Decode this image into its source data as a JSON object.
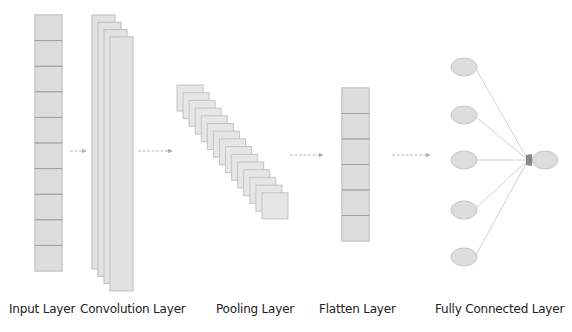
{
  "colors": {
    "cell_fill": "#dddddd",
    "cell_border": "#bdbdbd",
    "cell_divider": "#9e9e9e",
    "sheet_fill": "#e2e2e2",
    "sheet_border": "#c4c4c4",
    "arrow": "#b8b8b8",
    "node_fill": "#dcdcdc",
    "node_border": "#c6c6c6",
    "edge": "#d0d0d0",
    "arrowhead_dark": "#8a8a8a",
    "label": "#222222"
  },
  "layers": [
    {
      "id": "input",
      "label": "Input Layer",
      "type": "column",
      "cells": 10,
      "x": 35,
      "y": 15,
      "w": 27,
      "h": 256,
      "label_x": 9
    },
    {
      "id": "convolution",
      "label": "Convolution Layer",
      "type": "stacked-sheets",
      "sheets": 4,
      "x": 92,
      "y": 15,
      "w": 23,
      "h": 254,
      "dx": 6,
      "dy": 7.3,
      "label_x": 80
    },
    {
      "id": "pooling",
      "label": "Pooling Layer",
      "type": "stacked-squares",
      "squares": 15,
      "x": 177,
      "y": 85,
      "size": 26,
      "dx": 6.07,
      "dy": 7.7,
      "label_x": 216
    },
    {
      "id": "flatten",
      "label": "Flatten Layer",
      "type": "column",
      "cells": 6,
      "x": 342,
      "y": 88,
      "w": 27,
      "h": 153,
      "label_x": 319
    },
    {
      "id": "fully_connected",
      "label": "Fully Connected Layer",
      "type": "nodes",
      "label_x": 435,
      "inputs": [
        {
          "cx": 464,
          "cy": 67
        },
        {
          "cx": 464,
          "cy": 115
        },
        {
          "cx": 464,
          "cy": 160
        },
        {
          "cx": 464,
          "cy": 210
        },
        {
          "cx": 464,
          "cy": 257
        }
      ],
      "output": {
        "cx": 545,
        "cy": 160
      },
      "rx": 13,
      "ry": 9
    }
  ],
  "arrows": [
    {
      "x1": 70,
      "x2": 86,
      "y": 151
    },
    {
      "x1": 138,
      "x2": 172,
      "y": 151
    },
    {
      "x1": 290,
      "x2": 323,
      "y": 155
    },
    {
      "x1": 392,
      "x2": 430,
      "y": 155
    }
  ]
}
